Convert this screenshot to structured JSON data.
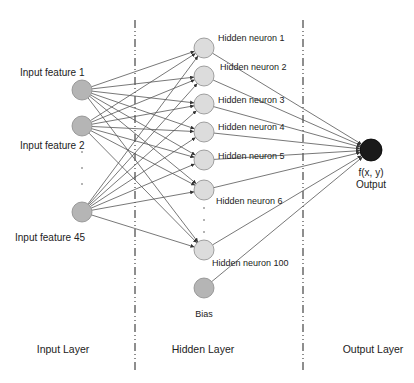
{
  "diagram": {
    "type": "neural-network",
    "colors": {
      "input_node": "#b5b5b5",
      "hidden_node": "#dcdcdc",
      "bias_node": "#b5b5b5",
      "output_node": "#1a1a1a",
      "edge": "#555555",
      "divider": "#444444",
      "node_stroke": "#8a8a8a"
    },
    "dividers": [
      135,
      303
    ],
    "input_nodes": [
      {
        "label": "Input feature 1",
        "x": 82,
        "y": 90,
        "label_x": 20,
        "label_y": 67
      },
      {
        "label": "Input feature 2",
        "x": 82,
        "y": 126,
        "label_x": 20,
        "label_y": 140
      },
      {
        "label": "Input feature 45",
        "x": 82,
        "y": 212,
        "label_x": 15,
        "label_y": 232
      }
    ],
    "input_ellipsis": ".\n.\n.",
    "hidden_nodes": [
      {
        "label": "Hidden neuron 1",
        "x": 204,
        "y": 48,
        "label_x": 218,
        "label_y": 33
      },
      {
        "label": "Hidden neuron 2",
        "x": 204,
        "y": 76,
        "label_x": 220,
        "label_y": 62
      },
      {
        "label": "Hidden neuron 3",
        "x": 204,
        "y": 104,
        "label_x": 218,
        "label_y": 95
      },
      {
        "label": "Hidden neuron 4",
        "x": 204,
        "y": 132,
        "label_x": 218,
        "label_y": 122
      },
      {
        "label": "Hidden neuron 5",
        "x": 204,
        "y": 160,
        "label_x": 218,
        "label_y": 151
      },
      {
        "label": "Hidden neuron 6",
        "x": 204,
        "y": 190,
        "label_x": 216,
        "label_y": 196
      },
      {
        "label": "Hidden neuron 100",
        "x": 204,
        "y": 250,
        "label_x": 212,
        "label_y": 258
      }
    ],
    "hidden_ellipsis": ".\n.\n.",
    "bias_node": {
      "label": "Bias",
      "x": 204,
      "y": 288,
      "label_x": 204,
      "label_y": 309
    },
    "output_node": {
      "label_top": "f(x, y)",
      "label_bottom": "Output",
      "x": 371,
      "y": 150,
      "label_x": 371,
      "label_y": 167
    },
    "layers": [
      {
        "label": "Input Layer",
        "x": 63
      },
      {
        "label": "Hidden Layer",
        "x": 203
      },
      {
        "label": "Output Layer",
        "x": 373
      }
    ]
  }
}
